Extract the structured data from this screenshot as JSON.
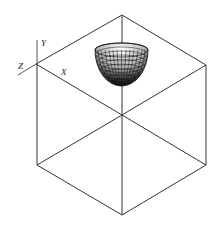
{
  "diagram": {
    "type": "isometric-cube-with-hemisphere",
    "axes": {
      "y_label": "Y",
      "z_label": "Z",
      "x_label": "X"
    },
    "colors": {
      "line": "#333333",
      "axis": "#555555",
      "mesh": "#111111",
      "background": "#ffffff"
    },
    "shape": "hemisphere (wireframe mesh, dome down)"
  }
}
